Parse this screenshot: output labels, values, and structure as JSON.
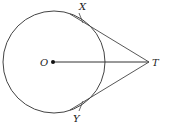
{
  "diagram": {
    "colors": {
      "stroke": "#444444",
      "text": "#222222",
      "background": "#ffffff"
    },
    "circle": {
      "center": [
        54,
        62
      ],
      "radius": 51
    },
    "points": {
      "O": {
        "label": "O",
        "x": 53,
        "y": 62
      },
      "T": {
        "label": "T",
        "x": 149,
        "y": 62
      },
      "X": {
        "label": "X",
        "x": 81,
        "y": 19
      },
      "Y": {
        "label": "Y",
        "x": 81,
        "y": 105
      }
    },
    "segments": [
      {
        "from": "O",
        "to": "T"
      },
      {
        "from": "X",
        "to": "T"
      },
      {
        "from": "Y",
        "to": "T"
      }
    ]
  }
}
